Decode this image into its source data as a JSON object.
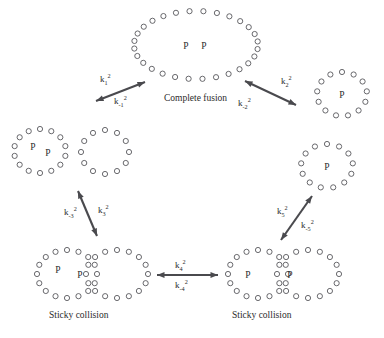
{
  "figure": {
    "type": "reaction-cycle-diagram",
    "background_color": "#ffffff",
    "ink_color": "#2b2b2b",
    "vesicle_stroke_color": "#58585c",
    "arrow_color": "#4a4a4e"
  },
  "cargo_symbol": "P",
  "states": [
    {
      "id": "complete-fusion",
      "caption": "Complete fusion",
      "caption_x": 164,
      "caption_y": 101,
      "vesicles": [
        {
          "cx": 196,
          "cy": 45,
          "rx": 62,
          "ry": 34,
          "n": 28,
          "start_deg": -96
        }
      ],
      "cargo": [
        {
          "x": 186,
          "y": 49,
          "label": "P"
        },
        {
          "x": 204,
          "y": 49,
          "label": "P"
        }
      ]
    },
    {
      "id": "top-right-single",
      "caption": "",
      "caption_x": 0,
      "caption_y": 0,
      "vesicles": [
        {
          "cx": 342,
          "cy": 94,
          "rx": 25,
          "ry": 22,
          "n": 13,
          "start_deg": -90
        }
      ],
      "cargo": [
        {
          "x": 342,
          "y": 98,
          "label": "P"
        }
      ]
    },
    {
      "id": "right-middle-single",
      "caption": "",
      "caption_x": 0,
      "caption_y": 0,
      "vesicles": [
        {
          "cx": 327,
          "cy": 166,
          "rx": 26,
          "ry": 22,
          "n": 13,
          "start_deg": -90
        }
      ],
      "cargo": [
        {
          "x": 327,
          "y": 170,
          "label": "P"
        }
      ]
    },
    {
      "id": "left-middle-pair",
      "caption": "",
      "caption_x": 0,
      "caption_y": 0,
      "vesicles": [
        {
          "cx": 40,
          "cy": 151,
          "rx": 26,
          "ry": 22,
          "n": 14,
          "start_deg": -90
        },
        {
          "cx": 105,
          "cy": 152,
          "rx": 24,
          "ry": 22,
          "n": 12,
          "start_deg": -90
        }
      ],
      "cargo": [
        {
          "x": 33,
          "y": 150,
          "label": "P"
        },
        {
          "x": 48,
          "y": 156,
          "label": "P"
        }
      ]
    },
    {
      "id": "sticky-collision-left",
      "caption": "Sticky collision",
      "caption_x": 49,
      "caption_y": 318,
      "vesicles": [
        {
          "cx": 67,
          "cy": 274,
          "rx": 30,
          "ry": 24,
          "n": 16,
          "start_deg": -90
        },
        {
          "cx": 117,
          "cy": 274,
          "rx": 31,
          "ry": 24,
          "n": 16,
          "start_deg": -90
        }
      ],
      "cargo": [
        {
          "x": 58,
          "y": 273,
          "label": "P"
        },
        {
          "x": 80,
          "y": 278,
          "label": "P"
        }
      ]
    },
    {
      "id": "sticky-collision-right",
      "caption": "Sticky collision",
      "caption_x": 232,
      "caption_y": 318,
      "vesicles": [
        {
          "cx": 258,
          "cy": 274,
          "rx": 30,
          "ry": 24,
          "n": 16,
          "start_deg": -90
        },
        {
          "cx": 308,
          "cy": 274,
          "rx": 31,
          "ry": 24,
          "n": 16,
          "start_deg": -90
        }
      ],
      "cargo": [
        {
          "x": 248,
          "y": 278,
          "label": "P"
        },
        {
          "x": 290,
          "y": 278,
          "label": "P"
        }
      ]
    }
  ],
  "transitions": [
    {
      "id": "k1",
      "x1": 96,
      "y1": 101,
      "x2": 145,
      "y2": 82,
      "forward": {
        "text": "k",
        "sub": "1",
        "sup": "2",
        "x": 100,
        "y": 82
      },
      "reverse": {
        "text": "k",
        "sub": "-1",
        "sup": "2",
        "x": 114,
        "y": 104
      }
    },
    {
      "id": "k2",
      "x1": 245,
      "y1": 81,
      "x2": 296,
      "y2": 105,
      "forward": {
        "text": "k",
        "sub": "2",
        "sup": "2",
        "x": 281,
        "y": 84
      },
      "reverse": {
        "text": "k",
        "sub": "-2",
        "sup": "2",
        "x": 238,
        "y": 106
      }
    },
    {
      "id": "k3",
      "x1": 78,
      "y1": 191,
      "x2": 97,
      "y2": 236,
      "forward": {
        "text": "k",
        "sub": "3",
        "sup": "2",
        "x": 98,
        "y": 213
      },
      "reverse": {
        "text": "k",
        "sub": "-3",
        "sup": "2",
        "x": 64,
        "y": 215
      }
    },
    {
      "id": "k5",
      "x1": 281,
      "y1": 240,
      "x2": 312,
      "y2": 196,
      "forward": {
        "text": "k",
        "sub": "5",
        "sup": "2",
        "x": 277,
        "y": 214
      },
      "reverse": {
        "text": "k",
        "sub": "-5",
        "sup": "2",
        "x": 301,
        "y": 228
      }
    },
    {
      "id": "k4",
      "x1": 157,
      "y1": 275,
      "x2": 218,
      "y2": 275,
      "forward": {
        "text": "k",
        "sub": "4",
        "sup": "2",
        "x": 175,
        "y": 268
      },
      "reverse": {
        "text": "k",
        "sub": "-4",
        "sup": "2",
        "x": 175,
        "y": 288
      }
    }
  ]
}
